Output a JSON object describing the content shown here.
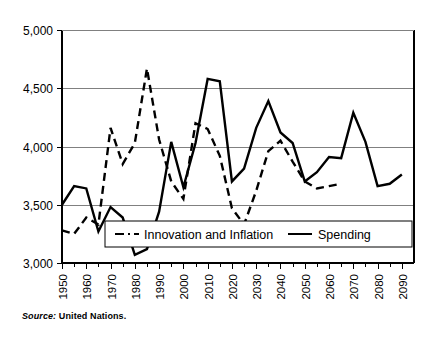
{
  "source_note": {
    "label": "Source:",
    "value": "United Nations."
  },
  "legend": {
    "position": "inside-bottom-center",
    "entries": [
      {
        "name": "Innovation and Inflation",
        "style": "dashed"
      },
      {
        "name": "Spending",
        "style": "solid"
      }
    ]
  },
  "chart_data": {
    "type": "line",
    "title": "",
    "subtitle": "",
    "xlabel": "",
    "ylabel": "",
    "xlim": [
      1950,
      2095
    ],
    "ylim": [
      3000,
      5000
    ],
    "grid": true,
    "grid_axis": "y",
    "legend_position": "inside-bottom-center",
    "yticks": [
      3000,
      3500,
      4000,
      4500,
      5000
    ],
    "ytick_labels": [
      "3,000",
      "3,500",
      "4,000",
      "4,500",
      "5,000"
    ],
    "xticks": [
      1950,
      1955,
      1960,
      1965,
      1970,
      1975,
      1980,
      1985,
      1990,
      1995,
      2000,
      2005,
      2010,
      2015,
      2020,
      2025,
      2030,
      2035,
      2040,
      2045,
      2050,
      2055,
      2060,
      2065,
      2070,
      2075,
      2080,
      2085,
      2090
    ],
    "xtick_labels": [
      "1950",
      "",
      "1960",
      "",
      "1970",
      "",
      "1980",
      "",
      "1990",
      "",
      "2000",
      "",
      "2010",
      "",
      "2020",
      "",
      "2030",
      "",
      "2040",
      "",
      "2050",
      "",
      "2060",
      "",
      "2070",
      "",
      "2080",
      "",
      "2090"
    ],
    "minor_tick_interval": 5,
    "series": [
      {
        "name": "Innovation and Inflation",
        "style": "dashed",
        "color": "#000000",
        "x": [
          1950,
          1955,
          1960,
          1965,
          1970,
          1975,
          1980,
          1985,
          1990,
          1995,
          2000,
          2005,
          2010,
          2015,
          2020,
          2025,
          2030,
          2035,
          2040,
          2045,
          2050,
          2055,
          2060,
          2065
        ],
        "values": [
          3280,
          3250,
          3390,
          3330,
          4160,
          3850,
          4030,
          4670,
          4060,
          3700,
          3550,
          4200,
          4150,
          3920,
          3470,
          3330,
          3620,
          3960,
          4050,
          3870,
          3700,
          3640,
          3660,
          3680
        ]
      },
      {
        "name": "Spending",
        "style": "solid",
        "color": "#000000",
        "x": [
          1950,
          1955,
          1960,
          1965,
          1970,
          1975,
          1980,
          1985,
          1990,
          1995,
          2000,
          2005,
          2010,
          2015,
          2020,
          2025,
          2030,
          2035,
          2040,
          2045,
          2050,
          2055,
          2060,
          2065,
          2070,
          2075,
          2080,
          2085,
          2090
        ],
        "values": [
          3500,
          3660,
          3640,
          3270,
          3480,
          3390,
          3070,
          3120,
          3440,
          4040,
          3650,
          4030,
          4580,
          4560,
          3700,
          3810,
          4160,
          4390,
          4120,
          4030,
          3700,
          3780,
          3910,
          3900,
          4290,
          4040,
          3660,
          3680,
          3760
        ]
      }
    ]
  }
}
